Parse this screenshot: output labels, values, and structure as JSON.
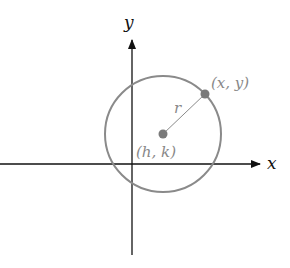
{
  "diagram": {
    "axes": {
      "x_label": "x",
      "y_label": "y"
    },
    "center": {
      "label": "(h, k)"
    },
    "point": {
      "label": "(x, y)"
    },
    "radius": {
      "label": "r"
    },
    "colors": {
      "axis": "#111111",
      "circle": "#8a8a8a",
      "point": "#7a7a7a",
      "label": "#888888"
    }
  }
}
